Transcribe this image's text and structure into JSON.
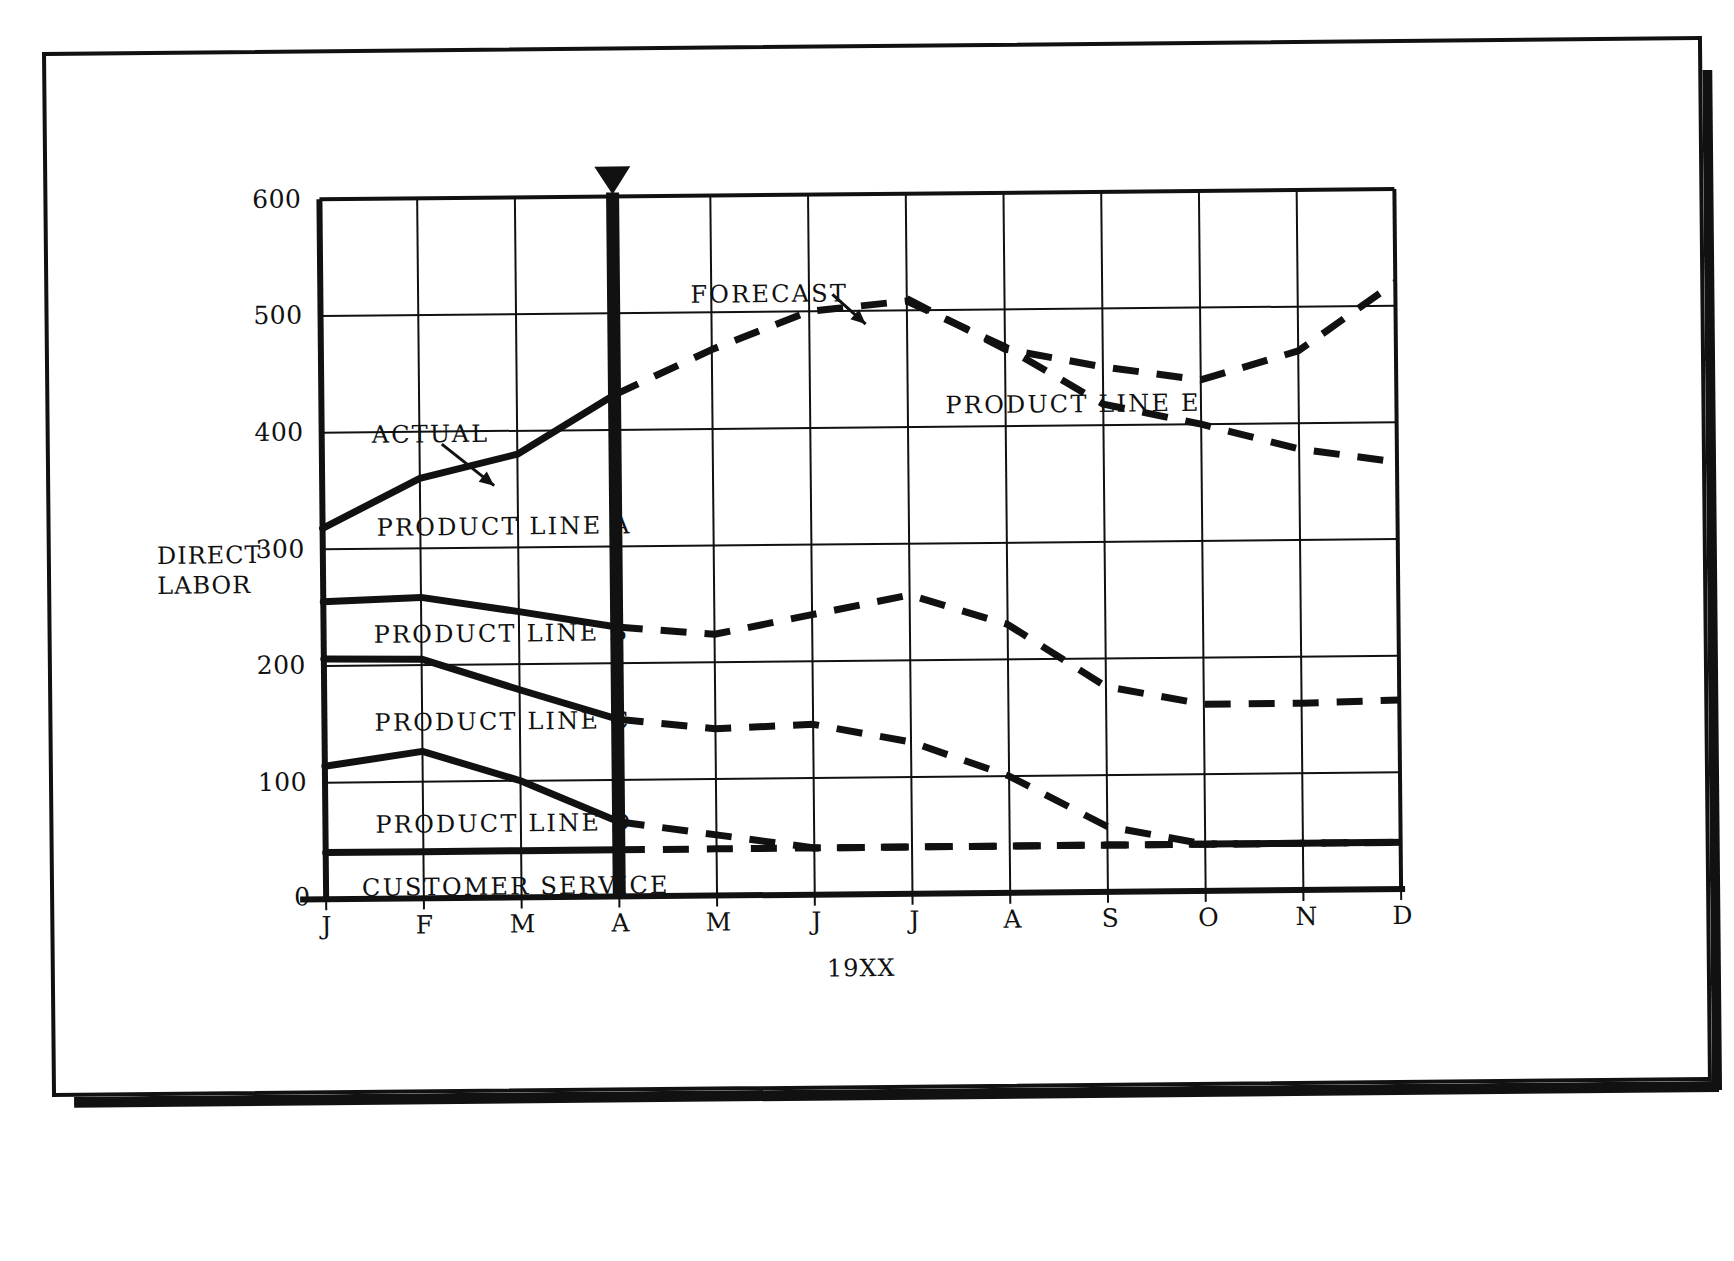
{
  "chart_data": {
    "type": "line",
    "title": "",
    "ylabel": "DIRECT LABOR",
    "xlabel": "19XX",
    "ylim": [
      0,
      600
    ],
    "ytick_labels": [
      "0",
      "100",
      "200",
      "300",
      "400",
      "500",
      "600"
    ],
    "ytick_values": [
      0,
      100,
      200,
      300,
      400,
      500,
      600
    ],
    "grid": true,
    "categories": [
      "J",
      "F",
      "M",
      "A",
      "M",
      "J",
      "J",
      "A",
      "S",
      "O",
      "N",
      "D"
    ],
    "legend_position": "inline-labels",
    "divider": {
      "at_category": "A",
      "label_left": "ACTUAL",
      "label_right": "FORECAST"
    },
    "series": [
      {
        "name": "PRODUCT LINE A",
        "style_actual": "solid",
        "style_forecast": "dashed",
        "values": [
          318,
          360,
          380,
          430,
          468,
          500,
          508,
          468,
          418,
          400,
          378,
          366
        ]
      },
      {
        "name": "PRODUCT LINE E",
        "style_actual": "none",
        "style_forecast": "dashed",
        "values": [
          null,
          null,
          null,
          null,
          null,
          null,
          510,
          466,
          450,
          438,
          462,
          520
        ]
      },
      {
        "name": "PRODUCT LINE B",
        "style_actual": "solid",
        "style_forecast": "dashed",
        "values": [
          255,
          258,
          245,
          231,
          224,
          240,
          256,
          230,
          176,
          160,
          160,
          162
        ]
      },
      {
        "name": "PRODUCT LINE C",
        "style_actual": "solid",
        "style_forecast": "dashed",
        "values": [
          206,
          205,
          178,
          152,
          143,
          146,
          130,
          100,
          56,
          40,
          40,
          40
        ]
      },
      {
        "name": "PRODUCT LINE D",
        "style_actual": "solid",
        "style_forecast": "dashed",
        "values": [
          114,
          126,
          100,
          64,
          52,
          40,
          40,
          40,
          40,
          40,
          40,
          40
        ]
      },
      {
        "name": "CUSTOMER SERVICE",
        "style_actual": "solid",
        "style_forecast": "dashed",
        "values": [
          40,
          40,
          40,
          40,
          40,
          40,
          40,
          40,
          40,
          40,
          40,
          40
        ]
      }
    ],
    "annotations": [
      {
        "text": "ACTUAL",
        "points_to": "solid line, PRODUCT LINE A, Feb-Mar"
      },
      {
        "text": "FORECAST",
        "points_to": "dashed line, PRODUCT LINE A, May-Jun"
      }
    ],
    "inline_labels": [
      "PRODUCT LINE A",
      "PRODUCT LINE B",
      "PRODUCT LINE C",
      "PRODUCT LINE D",
      "CUSTOMER SERVICE",
      "PRODUCT LINE E"
    ],
    "colors": {
      "ink": "#111111",
      "background": "#ffffff"
    }
  },
  "axis": {
    "y_title_line1": "DIRECT",
    "y_title_line2": "LABOR",
    "x_title": "19XX",
    "zero": "0"
  }
}
